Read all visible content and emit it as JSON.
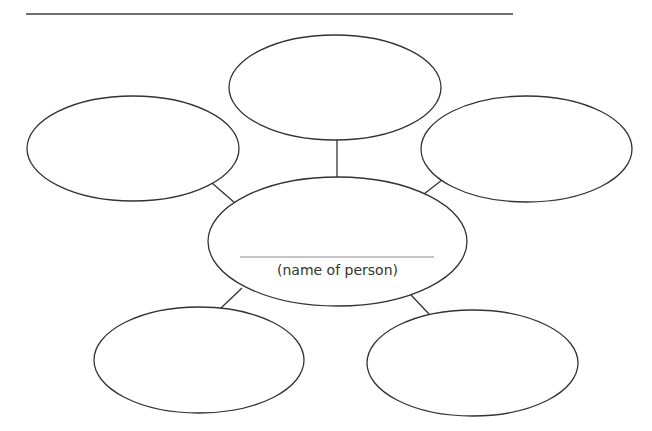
{
  "diagram": {
    "type": "character-web",
    "top_line": "",
    "center": {
      "name_value": "",
      "label": "(name of person)"
    },
    "bubbles": [
      {
        "position": "top",
        "text": ""
      },
      {
        "position": "left",
        "text": ""
      },
      {
        "position": "right",
        "text": ""
      },
      {
        "position": "bottom-left",
        "text": ""
      },
      {
        "position": "bottom-right",
        "text": ""
      }
    ],
    "colors": {
      "stroke": "#333333",
      "name_line": "#8a8a8a",
      "top_rule": "#6e6e6e",
      "background": "#ffffff"
    }
  }
}
